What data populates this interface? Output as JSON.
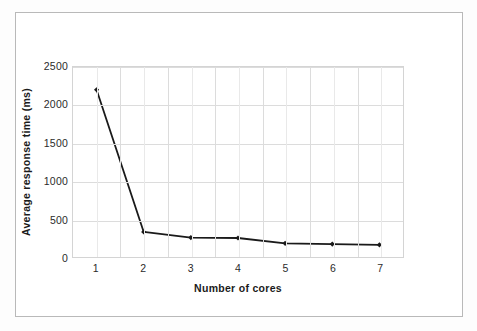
{
  "figure": {
    "kind": "scanned-figure",
    "frame_color": "#b9b9b9",
    "background": "#ffffff"
  },
  "chart_data": {
    "type": "line",
    "title": "",
    "subtitle": "",
    "xlabel": "Number of cores",
    "ylabel": "Average response time (ms)",
    "categories": [
      "1",
      "2",
      "3",
      "4",
      "5",
      "6",
      "7"
    ],
    "x": [
      1,
      2,
      3,
      4,
      5,
      6,
      7
    ],
    "values": [
      2200,
      330,
      255,
      250,
      180,
      170,
      160
    ],
    "series": [
      {
        "name": "Average response time (ms)",
        "values": [
          2200,
          330,
          255,
          250,
          180,
          170,
          160
        ],
        "color": "#1a1a1a",
        "marker": "diamond",
        "line_width": 1.8
      }
    ],
    "ylim": [
      0,
      2500
    ],
    "yticks": [
      0,
      500,
      1000,
      1500,
      2000,
      2500
    ],
    "ytick_labels": [
      "0",
      "500",
      "1000",
      "1500",
      "2000",
      "2500"
    ],
    "xtick_labels": [
      "1",
      "2",
      "3",
      "4",
      "5",
      "6",
      "7"
    ],
    "grid": {
      "horizontal": true,
      "vertical": true,
      "minor_vertical": true,
      "color": "#dcdcdc"
    },
    "legend": {
      "visible": false,
      "position": "none",
      "entries": []
    },
    "plot_border_color": "#d4d4d4"
  }
}
